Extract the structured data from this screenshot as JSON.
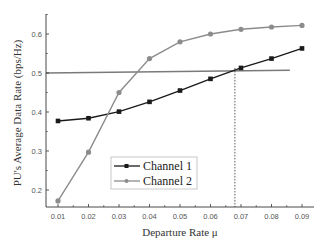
{
  "chart_data": {
    "type": "line",
    "title": "",
    "xlabel": "Departure Rate μ",
    "ylabel": "PU's Average Data Rate (bps/Hz)",
    "x": [
      0.01,
      0.02,
      0.03,
      0.04,
      0.05,
      0.06,
      0.07,
      0.08,
      0.09
    ],
    "xticks": [
      "0.01",
      "0.02",
      "0.03",
      "0.04",
      "0.05",
      "0.06",
      "0.07",
      "0.08",
      "0.09"
    ],
    "yticks": [
      "0.2",
      "0.3",
      "0.4",
      "0.5",
      "0.6"
    ],
    "xlim": [
      0.0075,
      0.0925
    ],
    "ylim": [
      0.155,
      0.655
    ],
    "grid": false,
    "legend_position": "lower center-left inside",
    "series": [
      {
        "name": "Channel 1",
        "marker": "square",
        "color": "#1a1a1a",
        "values": [
          0.377,
          0.384,
          0.401,
          0.426,
          0.455,
          0.485,
          0.513,
          0.537,
          0.563
        ]
      },
      {
        "name": "Channel 2",
        "marker": "circle",
        "color": "#8c8c8c",
        "values": [
          0.172,
          0.297,
          0.45,
          0.537,
          0.58,
          0.6,
          0.612,
          0.618,
          0.622
        ]
      }
    ],
    "annotations": [
      {
        "type": "hline",
        "label": "threshold",
        "y_start": 0.5,
        "y_end": 0.507,
        "x_end": 0.086,
        "color": "#7a7a7a"
      },
      {
        "type": "vline-dotted",
        "x": 0.068,
        "y_from_axis_to": 0.513,
        "color": "#444444"
      }
    ]
  },
  "legend": {
    "items": [
      {
        "label": "Channel 1"
      },
      {
        "label": "Channel 2"
      }
    ]
  },
  "axes": {
    "x_title": "Departure Rate μ",
    "y_title": "PU's Average Data Rate (bps/Hz)"
  }
}
